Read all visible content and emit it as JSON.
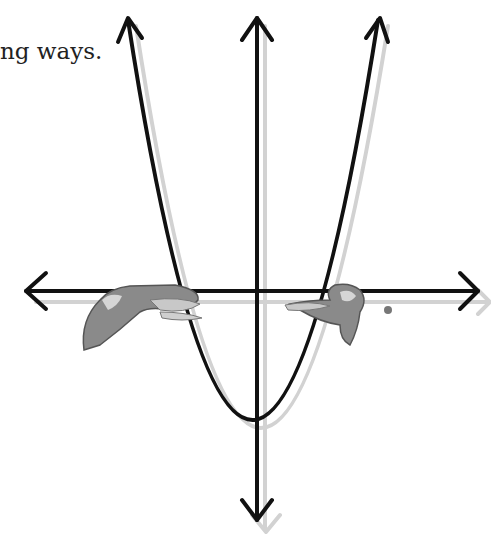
{
  "caption": "ng ways.",
  "diagram": {
    "type": "parabola-on-axes",
    "axes": {
      "x_axis": {
        "y": 291,
        "x_start": 24,
        "x_end": 480
      },
      "y_axis": {
        "x": 257,
        "y_start": 16,
        "y_end": 522
      }
    },
    "parabola": {
      "vertex": [
        250,
        447
      ],
      "left_top": [
        126,
        16
      ],
      "right_top": [
        378,
        16
      ],
      "x_intercepts_px": [
        170,
        322
      ]
    },
    "figures": [
      {
        "name": "left-figure",
        "position": "left x-intercept"
      },
      {
        "name": "right-figure",
        "position": "right x-intercept"
      }
    ],
    "colors": {
      "stroke": "#111111",
      "shadow": "#cfcfcf",
      "figure_fill": "#8a8a8a",
      "figure_light": "#c8c8c8"
    }
  }
}
